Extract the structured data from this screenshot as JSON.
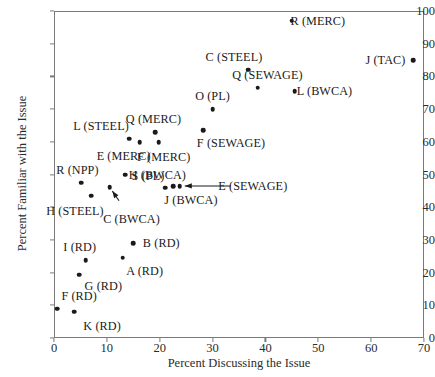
{
  "chart_data": {
    "type": "scatter",
    "title": "",
    "xlabel": "Percent Discussing the Issue",
    "ylabel": "Percent Familiar with the Issue",
    "xlim": [
      0,
      70
    ],
    "ylim": [
      0,
      100
    ],
    "xticks": [
      0,
      10,
      20,
      30,
      40,
      50,
      60,
      70
    ],
    "yticks": [
      0,
      10,
      20,
      30,
      40,
      50,
      60,
      70,
      80,
      90,
      100
    ],
    "grid": false,
    "legend": "none",
    "marker_color": "#1a1a1a",
    "axis_color": "#7a7a7a",
    "points": [
      {
        "label": "R (MERC)",
        "x": 45.0,
        "y": 97.0,
        "label_dx": 26,
        "label_dy": 0
      },
      {
        "label": "J (TAC)",
        "x": 68.0,
        "y": 85.0,
        "label_dx": -28,
        "label_dy": 0
      },
      {
        "label": "C (STEEL)",
        "x": 36.7,
        "y": 82.0,
        "label_dx": -14,
        "label_dy": -13
      },
      {
        "label": "Q (SEWAGE)",
        "x": 38.5,
        "y": 76.5,
        "label_dx": 10,
        "label_dy": -13
      },
      {
        "label": "L (BWCA)",
        "x": 45.5,
        "y": 75.5,
        "label_dx": 30,
        "label_dy": 0
      },
      {
        "label": "O (PL)",
        "x": 30.0,
        "y": 70.0,
        "label_dx": 0,
        "label_dy": -13
      },
      {
        "label": "F (SEWAGE)",
        "x": 28.2,
        "y": 63.5,
        "label_dx": 28,
        "label_dy": 13
      },
      {
        "label": "Q (MERC)",
        "x": 19.2,
        "y": 63.0,
        "label_dx": -2,
        "label_dy": -13
      },
      {
        "label": "L (STEEL)",
        "x": 14.2,
        "y": 61.0,
        "label_dx": -28,
        "label_dy": -13
      },
      {
        "label": "E (MERC)",
        "x": 16.2,
        "y": 59.8,
        "label_dx": -16,
        "label_dy": 14
      },
      {
        "label": "F (MERC)",
        "x": 19.8,
        "y": 59.8,
        "label_dx": 5,
        "label_dy": 15
      },
      {
        "label": "H (BWCA)",
        "x": 13.5,
        "y": 50.0,
        "label_dx": 32,
        "label_dy": 0
      },
      {
        "label": "R (NPP)",
        "x": 5.2,
        "y": 47.5,
        "label_dx": -4,
        "label_dy": -13
      },
      {
        "label": "C (BWCA)",
        "x": 10.5,
        "y": 46.2,
        "label_dx": 22,
        "label_dy": 32
      },
      {
        "label": "S (PL)",
        "x": 21.0,
        "y": 46.0,
        "label_dx": -17,
        "label_dy": -12
      },
      {
        "label": "J (BWCA)",
        "x": 22.5,
        "y": 46.5,
        "label_dx": 18,
        "label_dy": 14
      },
      {
        "label": "E (SEWAGE)",
        "x": 23.8,
        "y": 46.5,
        "label_dx": 73,
        "label_dy": 0
      },
      {
        "label": "H (STEEL)",
        "x": 7.0,
        "y": 43.5,
        "label_dx": -16,
        "label_dy": 15
      },
      {
        "label": "B (RD)",
        "x": 15.0,
        "y": 29.0,
        "label_dx": 28,
        "label_dy": 0
      },
      {
        "label": "A (RD)",
        "x": 13.0,
        "y": 24.5,
        "label_dx": 22,
        "label_dy": 13
      },
      {
        "label": "I (RD)",
        "x": 6.0,
        "y": 23.8,
        "label_dx": -6,
        "label_dy": -13
      },
      {
        "label": "G (RD)",
        "x": 4.8,
        "y": 19.3,
        "label_dx": 24,
        "label_dy": 11
      },
      {
        "label": "F (RD)",
        "x": 0.6,
        "y": 9.0,
        "label_dx": 22,
        "label_dy": -13
      },
      {
        "label": "K (RD)",
        "x": 3.8,
        "y": 8.0,
        "label_dx": 28,
        "label_dy": 14
      }
    ],
    "annotations": [
      {
        "name": "c-bwca-leader",
        "from_label": "C (BWCA)",
        "to_point_x": 10.5,
        "to_point_y": 46.2,
        "style": "arrow"
      },
      {
        "name": "e-sewage-leader",
        "from_label": "E (SEWAGE)",
        "to_point_x": 23.8,
        "to_point_y": 46.5,
        "style": "arrow"
      }
    ]
  }
}
